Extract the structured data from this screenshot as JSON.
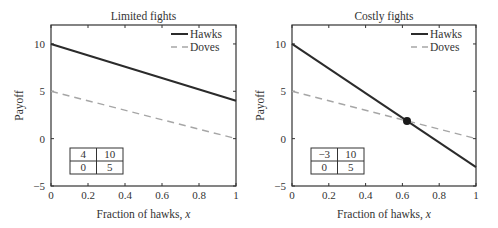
{
  "chart_data": [
    {
      "type": "line",
      "title": "Limited fights",
      "xlabel": "Fraction of hawks, x",
      "ylabel": "Payoff",
      "xlim": [
        0,
        1
      ],
      "ylim": [
        -5,
        12
      ],
      "xticks": [
        "0",
        "0.2",
        "0.4",
        "0.6",
        "0.8",
        "1"
      ],
      "yticks": [
        "-5",
        "0",
        "5",
        "10"
      ],
      "grid": false,
      "legend_position": "upper right",
      "x": [
        0,
        1
      ],
      "series": [
        {
          "name": "Hawks",
          "style": "solid",
          "values": [
            10,
            4
          ]
        },
        {
          "name": "Doves",
          "style": "dashed",
          "values": [
            5,
            0
          ]
        }
      ],
      "payoff_matrix": [
        [
          "4",
          "10"
        ],
        [
          "0",
          "5"
        ]
      ],
      "equilibrium": null
    },
    {
      "type": "line",
      "title": "Costly fights",
      "xlabel": "Fraction of hawks, x",
      "ylabel": "Payoff",
      "xlim": [
        0,
        1
      ],
      "ylim": [
        -5,
        12
      ],
      "xticks": [
        "0",
        "0.2",
        "0.4",
        "0.6",
        "0.8",
        "1"
      ],
      "yticks": [
        "-5",
        "0",
        "5",
        "10"
      ],
      "grid": false,
      "legend_position": "upper right",
      "x": [
        0,
        1
      ],
      "series": [
        {
          "name": "Hawks",
          "style": "solid",
          "values": [
            10,
            -3
          ]
        },
        {
          "name": "Doves",
          "style": "dashed",
          "values": [
            5,
            0
          ]
        }
      ],
      "payoff_matrix": [
        [
          "−3",
          "10"
        ],
        [
          "0",
          "5"
        ]
      ],
      "equilibrium": {
        "x": 0.625,
        "y": 1.875
      }
    }
  ],
  "colors": {
    "hawks": "#2b2b2b",
    "doves": "#a6a6a6",
    "axes": "#333333"
  }
}
